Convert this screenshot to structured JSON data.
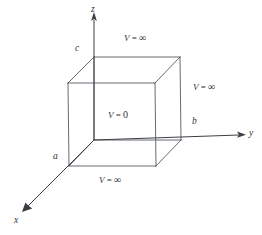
{
  "figure": {
    "axes": [
      {
        "name": "z",
        "label": "z",
        "x": 93,
        "y": 5,
        "direction": "up"
      },
      {
        "name": "y",
        "label": "y",
        "x": 249,
        "y": 129,
        "direction": "right"
      },
      {
        "name": "x",
        "label": "x",
        "x": 14,
        "y": 216,
        "direction": "down-left"
      }
    ],
    "dimensions": [
      {
        "name": "a",
        "label": "a",
        "x": 53,
        "y": 152,
        "axis": "x"
      },
      {
        "name": "b",
        "label": "b",
        "x": 192,
        "y": 117,
        "axis": "y"
      },
      {
        "name": "c",
        "label": "c",
        "x": 75,
        "y": 44,
        "axis": "z"
      }
    ],
    "potentials": [
      {
        "name": "top-wall",
        "var": "V",
        "eq": " = ",
        "value": "∞",
        "x": 124,
        "y": 33
      },
      {
        "name": "right-wall",
        "var": "V",
        "eq": " = ",
        "value": "∞",
        "x": 193,
        "y": 82
      },
      {
        "name": "interior",
        "var": "V",
        "eq": " = ",
        "value": "0",
        "x": 108,
        "y": 110
      },
      {
        "name": "bottom-wall",
        "var": "V",
        "eq": " = ",
        "value": "∞",
        "x": 99,
        "y": 175
      }
    ],
    "colors": {
      "edge": "#555a60",
      "axis": "#3a3f45",
      "text": "#2e3237",
      "background": "#ffffff"
    },
    "cube": {
      "front_top_left": [
        68,
        83
      ],
      "front_top_right": [
        155,
        83
      ],
      "front_bottom_left": [
        69,
        166
      ],
      "front_bottom_right": [
        156,
        166
      ],
      "back_top_left": [
        94,
        57
      ],
      "back_top_right": [
        180,
        57
      ],
      "back_bottom_left": [
        94,
        140
      ],
      "back_bottom_right": [
        181,
        140
      ]
    }
  }
}
